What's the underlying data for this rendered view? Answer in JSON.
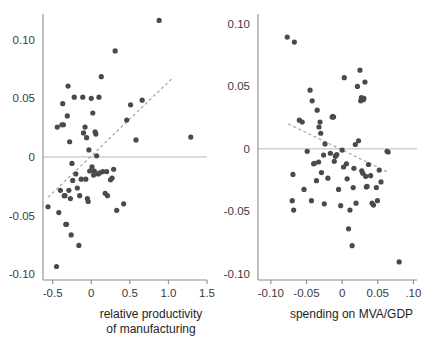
{
  "figure": {
    "background_color": "#ffffff",
    "point_color": "#4a4a4a",
    "trendline_color": "#a8a8a8",
    "axis_color": "#8c8c8c",
    "zero_line_color": "#b0b0b0",
    "text_color": "#1e1e1e",
    "tick_text_color": "#3a3a3a"
  },
  "chart_data": [
    {
      "type": "scatter",
      "panel": "left",
      "title": "",
      "xlabel": "relative productivity of manufacturing",
      "xlabel_lines": [
        "relative productivity",
        "of manufacturing"
      ],
      "ylabel": "",
      "xlim": [
        -0.625,
        1.5
      ],
      "ylim": [
        -0.105,
        0.122
      ],
      "xticks": [
        -0.5,
        0,
        0.5,
        1.0,
        1.5
      ],
      "xticklabels": [
        "-0.5",
        "0",
        "0.5",
        "1.0",
        "1.5"
      ],
      "yticks": [
        0.1,
        0.05,
        0,
        -0.05,
        -0.1
      ],
      "yticklabels": [
        "0.10",
        "0.05",
        "0",
        "-0.05",
        "-0.10"
      ],
      "grid": false,
      "legend": "none",
      "zero_line": 0,
      "trendline": {
        "style": "dashed",
        "x": [
          -0.56,
          1.04
        ],
        "y": [
          -0.0345,
          0.0665
        ]
      },
      "points": [
        [
          -0.56,
          -0.0425
        ],
        [
          -0.45,
          -0.0935
        ],
        [
          -0.44,
          0.0255
        ],
        [
          -0.42,
          -0.0475
        ],
        [
          -0.4,
          -0.0285
        ],
        [
          -0.38,
          0.0275
        ],
        [
          -0.37,
          0.0455
        ],
        [
          -0.36,
          0.0275
        ],
        [
          -0.35,
          -0.033
        ],
        [
          -0.34,
          -0.033
        ],
        [
          -0.33,
          -0.0575
        ],
        [
          -0.32,
          -0.0575
        ],
        [
          -0.31,
          0.035
        ],
        [
          -0.3,
          0.0605
        ],
        [
          -0.29,
          -0.0285
        ],
        [
          -0.28,
          0.013
        ],
        [
          -0.27,
          -0.0355
        ],
        [
          -0.26,
          -0.0665
        ],
        [
          -0.25,
          -0.0055
        ],
        [
          -0.24,
          -0.02
        ],
        [
          -0.22,
          0.051
        ],
        [
          -0.2,
          -0.0145
        ],
        [
          -0.18,
          -0.0265
        ],
        [
          -0.16,
          -0.0755
        ],
        [
          -0.15,
          -0.033
        ],
        [
          -0.13,
          -0.019
        ],
        [
          -0.11,
          0.051
        ],
        [
          -0.1,
          0.0205
        ],
        [
          -0.08,
          0.0255
        ],
        [
          -0.07,
          -0.019
        ],
        [
          -0.06,
          0.0165
        ],
        [
          -0.05,
          -0.0355
        ],
        [
          -0.04,
          -0.038
        ],
        [
          -0.03,
          0.006
        ],
        [
          -0.02,
          -0.012
        ],
        [
          0.0,
          0.05
        ],
        [
          0.01,
          -0.0085
        ],
        [
          0.02,
          0.0375
        ],
        [
          0.03,
          -0.0155
        ],
        [
          0.04,
          -0.012
        ],
        [
          0.05,
          0.0215
        ],
        [
          0.06,
          0.0195
        ],
        [
          0.07,
          0.001
        ],
        [
          0.09,
          -0.0145
        ],
        [
          0.1,
          0.051
        ],
        [
          0.11,
          -0.0135
        ],
        [
          0.13,
          0.0685
        ],
        [
          0.15,
          -0.0125
        ],
        [
          0.18,
          -0.031
        ],
        [
          0.2,
          -0.0125
        ],
        [
          0.21,
          -0.033
        ],
        [
          0.25,
          -0.0195
        ],
        [
          0.27,
          -0.018
        ],
        [
          0.29,
          -0.0105
        ],
        [
          0.31,
          0.0905
        ],
        [
          0.33,
          -0.0455
        ],
        [
          0.42,
          -0.04
        ],
        [
          0.46,
          0.0315
        ],
        [
          0.51,
          0.0445
        ],
        [
          0.58,
          0.0145
        ],
        [
          0.66,
          0.0485
        ],
        [
          0.88,
          0.1165
        ],
        [
          1.29,
          0.017
        ]
      ]
    },
    {
      "type": "scatter",
      "panel": "right",
      "title": "",
      "xlabel": "spending on MVA/GDP",
      "xlabel_lines": [
        "spending on MVA/GDP"
      ],
      "ylabel": "",
      "xlim": [
        -0.118,
        0.105
      ],
      "ylim": [
        -0.105,
        0.108
      ],
      "xticks": [
        -0.1,
        -0.05,
        0,
        0.05,
        0.1
      ],
      "xticklabels": [
        "-0.10",
        "-0.05",
        "0",
        "0.05",
        ".10"
      ],
      "yticks": [
        0.1,
        0.05,
        0,
        -0.05,
        -0.1
      ],
      "yticklabels": [
        "0.10",
        "0.05",
        "0",
        "-0.05",
        "-0.10"
      ],
      "grid": false,
      "legend": "none",
      "zero_line": 0,
      "trendline": {
        "style": "dashed",
        "x": [
          -0.0755,
          0.0655
        ],
        "y": [
          0.02,
          -0.019
        ]
      },
      "points": [
        [
          -0.077,
          0.0895
        ],
        [
          -0.07,
          -0.0415
        ],
        [
          -0.069,
          -0.0205
        ],
        [
          -0.068,
          -0.049
        ],
        [
          -0.067,
          0.0855
        ],
        [
          -0.06,
          0.023
        ],
        [
          -0.056,
          0.0215
        ],
        [
          -0.0535,
          -0.0325
        ],
        [
          -0.049,
          -0.002
        ],
        [
          -0.045,
          0.047
        ],
        [
          -0.043,
          -0.0415
        ],
        [
          -0.042,
          0.0385
        ],
        [
          -0.04,
          -0.012
        ],
        [
          -0.039,
          -0.0115
        ],
        [
          -0.036,
          -0.0255
        ],
        [
          -0.035,
          0.031
        ],
        [
          -0.033,
          -0.0105
        ],
        [
          -0.0325,
          0.0175
        ],
        [
          -0.031,
          0.0215
        ],
        [
          -0.03,
          0.0125
        ],
        [
          -0.029,
          -0.019
        ],
        [
          -0.026,
          -0.005
        ],
        [
          -0.025,
          -0.044
        ],
        [
          -0.024,
          0.004
        ],
        [
          -0.02,
          -0.0235
        ],
        [
          -0.0165,
          -0.0035
        ],
        [
          -0.014,
          0.0255
        ],
        [
          -0.013,
          0.026
        ],
        [
          -0.012,
          0.0255
        ],
        [
          -0.011,
          -0.01
        ],
        [
          -0.0095,
          -0.006
        ],
        [
          -0.009,
          -0.0055
        ],
        [
          -0.0075,
          -0.0045
        ],
        [
          -0.005,
          -0.0325
        ],
        [
          -0.002,
          -0.0455
        ],
        [
          0.0,
          -0.001
        ],
        [
          0.002,
          -0.0145
        ],
        [
          0.003,
          0.057
        ],
        [
          0.006,
          -0.012
        ],
        [
          0.007,
          -0.024
        ],
        [
          0.009,
          -0.064
        ],
        [
          0.011,
          -0.049
        ],
        [
          0.014,
          -0.0775
        ],
        [
          0.0155,
          -0.031
        ],
        [
          0.0165,
          -0.0155
        ],
        [
          0.0185,
          0.0035
        ],
        [
          0.0195,
          -0.0435
        ],
        [
          0.0215,
          0.05
        ],
        [
          0.023,
          0.0065
        ],
        [
          0.025,
          0.063
        ],
        [
          0.026,
          0.0385
        ],
        [
          0.027,
          0.041
        ],
        [
          0.0275,
          -0.0175
        ],
        [
          0.029,
          -0.0195
        ],
        [
          0.03,
          0.0395
        ],
        [
          0.0305,
          0.0405
        ],
        [
          0.032,
          0.0535
        ],
        [
          0.033,
          -0.022
        ],
        [
          0.034,
          -0.0305
        ],
        [
          0.035,
          -0.03
        ],
        [
          0.037,
          -0.0125
        ],
        [
          0.04,
          -0.0215
        ],
        [
          0.042,
          -0.0435
        ],
        [
          0.044,
          -0.045
        ],
        [
          0.048,
          -0.031
        ],
        [
          0.0495,
          -0.0415
        ],
        [
          0.052,
          -0.017
        ],
        [
          0.0545,
          -0.0265
        ],
        [
          0.063,
          -0.002
        ],
        [
          0.0645,
          -0.0025
        ],
        [
          0.08,
          -0.0905
        ]
      ]
    }
  ]
}
